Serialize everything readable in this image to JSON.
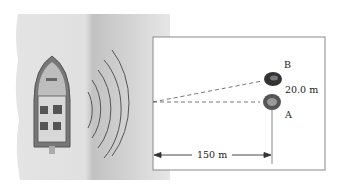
{
  "diagram": {
    "labels": {
      "point_b": "B",
      "point_a": "A",
      "separation": "20.0 m",
      "distance": "150 m"
    },
    "elements": [
      "boat",
      "sonar-waves",
      "rock-a",
      "rock-b",
      "dashed-sight-lines",
      "dimension-arrow"
    ],
    "colors": {
      "water_light": "#e2e2e2",
      "water_dark": "#c4c4c4",
      "boat_hull": "#7a7a7a",
      "frame": "#8a8a8a"
    }
  }
}
